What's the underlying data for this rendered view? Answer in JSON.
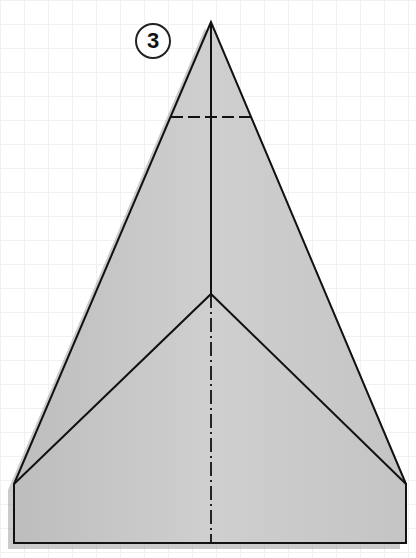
{
  "diagram": {
    "step_number": "3",
    "colors": {
      "paper": "#c8c8c8",
      "line": "#111111",
      "shadow": "#9a9a9a",
      "grid": "#f0f0f0"
    },
    "shape": {
      "apex": [
        211,
        22
      ],
      "inner_vertex": [
        211,
        294
      ],
      "left_corner": [
        14,
        484
      ],
      "right_corner": [
        406,
        484
      ],
      "bottom_left": [
        14,
        543
      ],
      "bottom_right": [
        406,
        543
      ]
    },
    "lines": {
      "outer_edges": "solid",
      "inner_fold_edges": "solid",
      "center_top": "solid",
      "center_bottom": "dash-dot (valley/mountain fold)",
      "horizontal_fold": "dashed at y=117"
    }
  }
}
